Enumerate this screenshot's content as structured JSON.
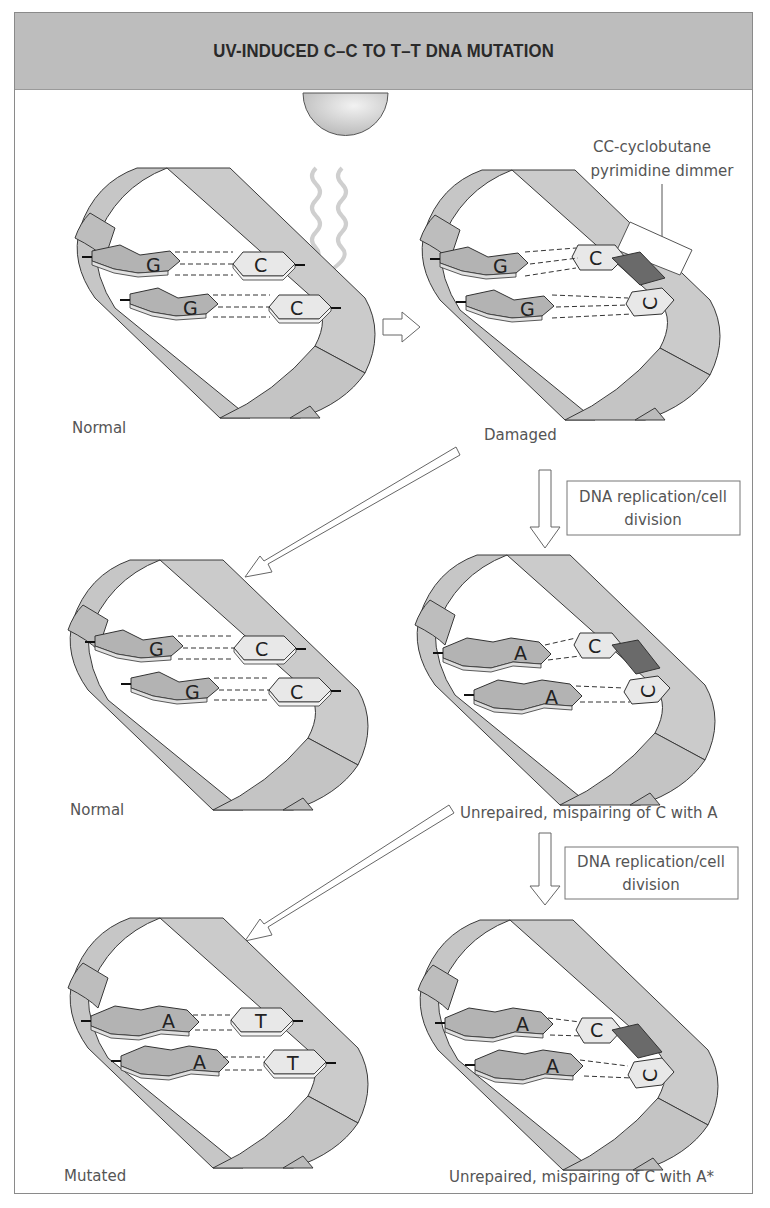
{
  "title": "UV-INDUCED C–C TO T–T DNA MUTATION",
  "colors": {
    "header_bg": "#bdbdbd",
    "ribbon": "#c8c8c8",
    "ribbon_stroke": "#3a3a3a",
    "purine": "#b5b5b5",
    "pyrimidine": "#e6e6e6",
    "dimer": "#6a6a6a",
    "uv_wave": "#cfcfcf"
  },
  "panels": [
    {
      "id": "normal-1",
      "label": "Normal",
      "pairs": [
        [
          "G",
          "C"
        ],
        [
          "G",
          "C"
        ]
      ],
      "dimer": false,
      "uv_source": true
    },
    {
      "id": "damaged",
      "label": "Damaged",
      "pairs": [
        [
          "G",
          "C"
        ],
        [
          "G",
          "C"
        ]
      ],
      "dimer": true,
      "annotation": {
        "line1": "CC-cyclobutane",
        "line2": "pyrimidine dimmer"
      }
    },
    {
      "id": "normal-2",
      "label": "Normal",
      "pairs": [
        [
          "G",
          "C"
        ],
        [
          "G",
          "C"
        ]
      ],
      "dimer": false
    },
    {
      "id": "mispaired-1",
      "label": "Unrepaired, mispairing of C with A",
      "pairs": [
        [
          "A",
          "C"
        ],
        [
          "A",
          "C"
        ]
      ],
      "dimer": true
    },
    {
      "id": "mutated",
      "label": "Mutated",
      "pairs": [
        [
          "A",
          "T"
        ],
        [
          "A",
          "T"
        ]
      ],
      "dimer": false
    },
    {
      "id": "mispaired-2",
      "label": "Unrepaired, mispairing of C with A*",
      "pairs": [
        [
          "A",
          "C"
        ],
        [
          "A",
          "C"
        ]
      ],
      "dimer": true
    }
  ],
  "steps": [
    {
      "line1": "DNA replication/cell",
      "line2": "division"
    },
    {
      "line1": "DNA replication/cell",
      "line2": "division"
    }
  ]
}
